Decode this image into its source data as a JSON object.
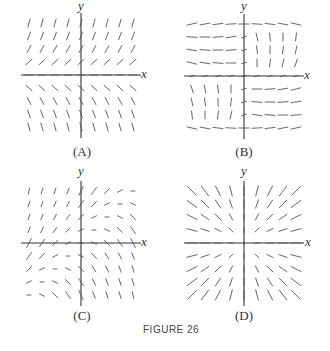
{
  "figure": {
    "title": "FIGURE 26"
  },
  "axes_labels": {
    "x": "x",
    "y": "y"
  },
  "panels": [
    {
      "id": "A",
      "caption": "(A)",
      "description": "Vector field: slopes steeper further from x-axis; positive above, negative below; independent of x",
      "origin": [
        81,
        75
      ],
      "rule": "A"
    },
    {
      "id": "B",
      "caption": "(B)",
      "description": "Vector field with swirling structure: near-horizontal in left-upper and right-lower regions, near-vertical in right-upper and left-lower",
      "origin": [
        244,
        76
      ],
      "rule": "B"
    },
    {
      "id": "C",
      "caption": "(C)",
      "description": "Vector field: vectors pointing down-right in upper right, up-left in lower left; short in upper-left and lower-right",
      "origin": [
        81,
        243
      ],
      "rule": "C"
    },
    {
      "id": "D",
      "caption": "(D)",
      "description": "Vector field with radial pattern: direction along y/x-like slope, longer further from origin",
      "origin": [
        244,
        243
      ],
      "rule": "D"
    }
  ],
  "colors": {
    "axis": "#333333",
    "vector": "#555555",
    "background": "#ffffff"
  }
}
